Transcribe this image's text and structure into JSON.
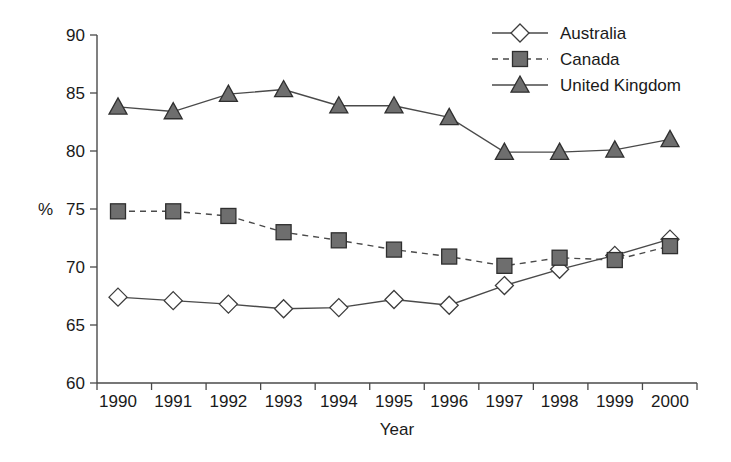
{
  "chart_data": {
    "type": "line",
    "title": "",
    "xlabel": "Year",
    "ylabel": "%",
    "categories": [
      "1990",
      "1991",
      "1992",
      "1993",
      "1994",
      "1995",
      "1996",
      "1997",
      "1998",
      "1999",
      "2000"
    ],
    "x": [
      1990,
      1991,
      1992,
      1993,
      1994,
      1995,
      1996,
      1997,
      1998,
      1999,
      2000
    ],
    "ylim": [
      60,
      90
    ],
    "yticks": [
      60,
      65,
      70,
      75,
      80,
      85,
      90
    ],
    "ytick_labels": [
      "60",
      "65",
      "70",
      "75",
      "80",
      "85",
      "90"
    ],
    "grid": false,
    "legend_position": "top-right",
    "series": [
      {
        "name": "Australia",
        "marker": "diamond-open",
        "linestyle": "solid",
        "color": "#4a4a4a",
        "marker_fill": "#ffffff",
        "values": [
          67.4,
          67.1,
          66.8,
          66.4,
          66.5,
          67.2,
          66.7,
          68.4,
          69.8,
          71.0,
          72.4
        ]
      },
      {
        "name": "Canada",
        "marker": "square-filled",
        "linestyle": "dashed",
        "color": "#4a4a4a",
        "marker_fill": "#6e6e6e",
        "values": [
          74.8,
          74.8,
          74.4,
          73.0,
          72.3,
          71.5,
          70.9,
          70.1,
          70.8,
          70.6,
          71.8
        ]
      },
      {
        "name": "United Kingdom",
        "marker": "triangle-filled",
        "linestyle": "solid",
        "color": "#4a4a4a",
        "marker_fill": "#6e6e6e",
        "values": [
          83.8,
          83.4,
          84.9,
          85.3,
          83.9,
          83.9,
          82.9,
          79.9,
          79.9,
          80.1,
          81.0
        ]
      }
    ]
  },
  "axes": {
    "y_axis_label": "%",
    "x_axis_label": "Year"
  },
  "legend": {
    "items": [
      {
        "label": "Australia"
      },
      {
        "label": "Canada"
      },
      {
        "label": "United Kingdom"
      }
    ]
  }
}
